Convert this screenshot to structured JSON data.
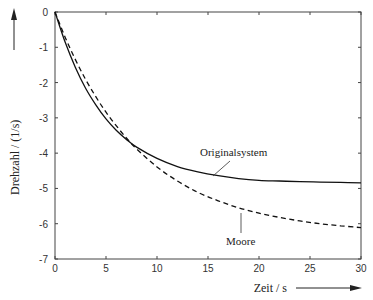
{
  "chart_data": {
    "type": "line",
    "title": "",
    "xlabel": "Zeit / s",
    "ylabel": "Drehzahl / (1/s)",
    "xlim": [
      0,
      30
    ],
    "ylim": [
      -7,
      0
    ],
    "xticks": [
      0,
      5,
      10,
      15,
      20,
      25,
      30
    ],
    "yticks": [
      0,
      -1,
      -2,
      -3,
      -4,
      -5,
      -6,
      -7
    ],
    "grid": false,
    "legend": "none (inline annotations)",
    "x": [
      0,
      1,
      2,
      3,
      4,
      5,
      6,
      7,
      8,
      10,
      12,
      14,
      16,
      18,
      20,
      22,
      24,
      26,
      28,
      30
    ],
    "series": [
      {
        "name": "Originalsystem",
        "style": "solid",
        "values": [
          0,
          -0.86,
          -1.57,
          -2.16,
          -2.63,
          -3.03,
          -3.35,
          -3.61,
          -3.83,
          -4.15,
          -4.38,
          -4.53,
          -4.64,
          -4.72,
          -4.77,
          -4.79,
          -4.81,
          -4.82,
          -4.83,
          -4.84
        ]
      },
      {
        "name": "Moore",
        "style": "dashed",
        "values": [
          0,
          -0.72,
          -1.35,
          -1.91,
          -2.4,
          -2.84,
          -3.22,
          -3.57,
          -3.88,
          -4.39,
          -4.79,
          -5.11,
          -5.35,
          -5.55,
          -5.7,
          -5.82,
          -5.92,
          -6.0,
          -6.06,
          -6.11
        ]
      }
    ],
    "annotations": [
      {
        "text": "Originalsystem",
        "points_to": [
          15,
          -4.6
        ]
      },
      {
        "text": "Moore",
        "points_to": [
          18,
          -5.5
        ]
      }
    ]
  },
  "axes": {
    "xlabel": "Zeit / s",
    "ylabel": "Drehzahl / (1/s)",
    "xtick_labels": [
      "0",
      "5",
      "10",
      "15",
      "20",
      "25",
      "30"
    ],
    "ytick_labels": [
      "0",
      "-1",
      "-2",
      "-3",
      "-4",
      "-5",
      "-6",
      "-7"
    ]
  },
  "annotations": {
    "original": "Originalsystem",
    "moore": "Moore"
  },
  "colors": {
    "axis": "#333333",
    "line": "#111111"
  }
}
